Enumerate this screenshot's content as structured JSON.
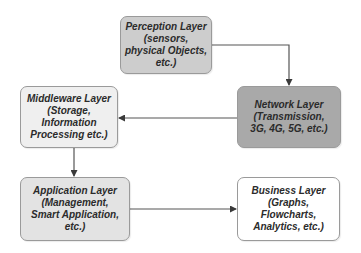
{
  "diagram": {
    "type": "iot-layered-architecture-flow",
    "colors": {
      "perception_fill": "#cdcdcd",
      "network_fill": "#a9a9a9",
      "middleware_fill": "#efefef",
      "application_fill": "#e3e3e3",
      "business_fill": "#ffffff",
      "border": "#9a9a9a",
      "arrow": "#3a3a3a",
      "text": "#2b2b2b"
    },
    "nodes": {
      "perception": {
        "title": "Perception Layer",
        "line2": "(sensors,",
        "line3": "physical Objects,",
        "line4": "etc.)"
      },
      "network": {
        "title": "Network Layer",
        "line2": "(Transmission,",
        "line3": "3G, 4G, 5G, etc.)"
      },
      "middleware": {
        "title": "Middleware Layer",
        "line2": "(Storage,",
        "line3": "Information",
        "line4": "Processing etc.)"
      },
      "application": {
        "title": "Application Layer",
        "line2": "(Management,",
        "line3": "Smart Application,",
        "line4": "etc.)"
      },
      "business": {
        "title": "Business Layer",
        "line2": "(Graphs,",
        "line3": "Flowcharts,",
        "line4": "Analytics, etc.)"
      }
    },
    "edges": [
      {
        "from": "perception",
        "to": "network"
      },
      {
        "from": "network",
        "to": "middleware"
      },
      {
        "from": "middleware",
        "to": "application"
      },
      {
        "from": "application",
        "to": "business"
      }
    ]
  }
}
